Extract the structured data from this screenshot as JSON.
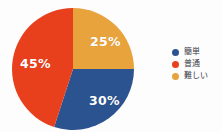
{
  "background_color": "#fdfdfd",
  "chart_data": {
    "type": "pie",
    "title": "",
    "subtitle": "",
    "xlabel": "",
    "ylabel": "",
    "grid": false,
    "legend_position": "right",
    "start_angle_deg": 0,
    "direction": "clockwise",
    "label_color": "#ffffff",
    "categories": [
      "簡単",
      "普通",
      "難しい"
    ],
    "values": [
      30,
      45,
      25
    ],
    "slices": [
      {
        "name": "簡単",
        "value": 30,
        "data_label": "30%",
        "color": "#2B5390",
        "legend_label": "簡単"
      },
      {
        "name": "普通",
        "value": 45,
        "data_label": "45%",
        "color": "#E8401C",
        "legend_label": "普通"
      },
      {
        "name": "難しい",
        "value": 25,
        "data_label": "25%",
        "color": "#E8A33D",
        "legend_label": "難しい"
      }
    ]
  },
  "pie": {
    "label_hard": "25%",
    "label_easy": "30%",
    "label_normal": "45%"
  },
  "legend": {
    "items": [
      {
        "label": "簡単",
        "color": "#2B5390"
      },
      {
        "label": "普通",
        "color": "#E8401C"
      },
      {
        "label": "難しい",
        "color": "#E8A33D"
      }
    ]
  }
}
